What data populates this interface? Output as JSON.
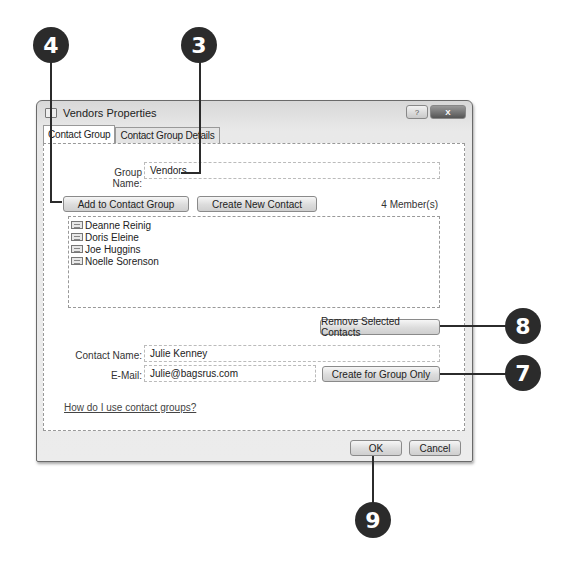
{
  "window": {
    "title": "Vendors Properties",
    "controls": {
      "help": "?",
      "close": "X"
    }
  },
  "tabs": [
    {
      "label": "Contact Group",
      "active": true
    },
    {
      "label": "Contact Group Details",
      "active": false
    }
  ],
  "group": {
    "name_label": "Group Name:",
    "name_value": "Vendors"
  },
  "actions": {
    "add_to_group": "Add to Contact Group",
    "create_new_contact": "Create New Contact",
    "remove_selected": "Remove Selected Contacts",
    "create_for_group_only": "Create for Group Only"
  },
  "members": {
    "count_text": "4 Member(s)",
    "items": [
      {
        "name": "Deanne Reinig"
      },
      {
        "name": "Doris Eleine"
      },
      {
        "name": "Joe Huggins"
      },
      {
        "name": "Noelle Sorenson"
      }
    ]
  },
  "contact": {
    "name_label": "Contact Name:",
    "name_value": "Julie Kenney",
    "email_label": "E-Mail:",
    "email_value": "Julie@bagsrus.com"
  },
  "help_link": "How do I use contact groups?",
  "footer": {
    "ok": "OK",
    "cancel": "Cancel"
  },
  "callouts": [
    {
      "number": "4"
    },
    {
      "number": "3"
    },
    {
      "number": "8"
    },
    {
      "number": "7"
    },
    {
      "number": "9"
    }
  ]
}
